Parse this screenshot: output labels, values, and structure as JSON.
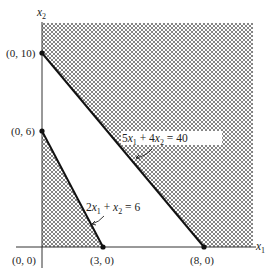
{
  "diagram": {
    "type": "linear-programming-feasible-region",
    "axes": {
      "x_label": "x",
      "x_sub": "1",
      "y_label": "x",
      "y_sub": "2"
    },
    "points": [
      {
        "id": "origin",
        "label": "(0, 0)",
        "x": 0,
        "y": 0
      },
      {
        "id": "p-0-6",
        "label": "(0, 6)",
        "x": 0,
        "y": 6
      },
      {
        "id": "p-0-10",
        "label": "(0, 10)",
        "x": 0,
        "y": 10
      },
      {
        "id": "p-3-0",
        "label": "(3, 0)",
        "x": 3,
        "y": 0
      },
      {
        "id": "p-8-0",
        "label": "(8, 0)",
        "x": 8,
        "y": 0
      }
    ],
    "constraints": [
      {
        "id": "c1",
        "equation": "2x1 + x2 = 6",
        "parts": {
          "a": "2",
          "v1": "x",
          "s1": "1",
          "op": " + ",
          "v2": "x",
          "s2": "2",
          "rhs": " = 6"
        },
        "shaded_side": "below"
      },
      {
        "id": "c2",
        "equation": "5x1 + 4x2 = 40",
        "parts": {
          "a": "5",
          "v1": "x",
          "s1": "1",
          "op": " + 4",
          "v2": "x",
          "s2": "2",
          "rhs": " = 40"
        },
        "shaded_side": "above"
      }
    ],
    "colors": {
      "hatch": "#555555",
      "line": "#111111",
      "background": "#ffffff"
    }
  }
}
